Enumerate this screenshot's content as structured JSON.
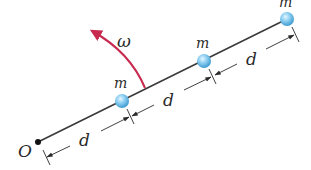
{
  "diagram": {
    "origin_label": "O",
    "angular_velocity_label": "ω",
    "masses": [
      {
        "label": "m"
      },
      {
        "label": "m"
      },
      {
        "label": "m"
      }
    ],
    "spacings": [
      {
        "label": "d"
      },
      {
        "label": "d"
      },
      {
        "label": "d"
      }
    ],
    "colors": {
      "rod": "#3a3a3a",
      "mass_fill": "#7cc6ee",
      "mass_highlight": "#d8f1ff",
      "omega_arrow": "#c8294f",
      "dimension": "#2a2a2a"
    }
  }
}
